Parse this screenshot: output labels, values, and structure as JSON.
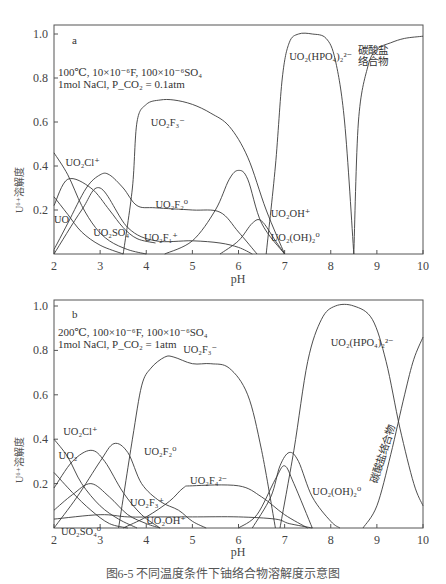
{
  "figure": {
    "caption": "图6-5  不同温度条件下铀络合物溶解度示意图",
    "xlabel": "pH",
    "ylabel": "U⁶⁺溶解度"
  },
  "chart_data": [
    {
      "type": "line",
      "panel": "a",
      "title": "a",
      "conditions_line1": "100℃, 10×10⁻⁶F, 100×10⁻⁶SO₄",
      "conditions_line2": "1mol NaCl, P_CO₂ = 0.1atm",
      "xlabel": "pH",
      "ylabel": "U⁶⁺溶解度",
      "xlim": [
        2,
        10
      ],
      "ylim": [
        0,
        1.0
      ],
      "xticks": [
        "2",
        "3",
        "4",
        "5",
        "6",
        "7",
        "8",
        "9",
        "10"
      ],
      "yticks": [
        "0.2",
        "0.4",
        "0.6",
        "0.8",
        "1.0"
      ],
      "labels": [
        {
          "text": "UO₂F₃⁻",
          "x": 4.1,
          "y": 0.58
        },
        {
          "text": "UO₂(HPO₄)₂²⁻",
          "x": 7.1,
          "y": 0.88
        },
        {
          "text": "碳酸盐",
          "x": 8.6,
          "y": 0.91
        },
        {
          "text": "络合物",
          "x": 8.6,
          "y": 0.86
        },
        {
          "text": "UO₂Cl⁺",
          "x": 2.25,
          "y": 0.4
        },
        {
          "text": "UO₂F₂⁰",
          "x": 4.2,
          "y": 0.21
        },
        {
          "text": "UO",
          "x": 2.0,
          "y": 0.14
        },
        {
          "text": "UO₂SO₄",
          "x": 2.85,
          "y": 0.08
        },
        {
          "text": "UO₂F₁⁺",
          "x": 3.95,
          "y": 0.06
        },
        {
          "text": "UO₂OH⁺",
          "x": 6.7,
          "y": 0.17
        },
        {
          "text": "UO₂(OH)₂⁰",
          "x": 6.7,
          "y": 0.06
        }
      ],
      "series": [
        {
          "name": "UO₂F₃⁻",
          "x": [
            3.5,
            3.7,
            3.8,
            4.0,
            4.3,
            4.6,
            5.0,
            5.4,
            5.8,
            6.2,
            6.6,
            7.0
          ],
          "y": [
            0.0,
            0.3,
            0.6,
            0.68,
            0.7,
            0.7,
            0.68,
            0.64,
            0.58,
            0.44,
            0.2,
            0.0
          ]
        },
        {
          "name": "UO₂(HPO₄)₂²⁻",
          "x": [
            6.6,
            6.8,
            6.95,
            7.1,
            7.3,
            7.6,
            7.9,
            8.1,
            8.3,
            8.5
          ],
          "y": [
            0.0,
            0.4,
            0.8,
            0.96,
            1.0,
            1.0,
            0.98,
            0.88,
            0.6,
            0.0
          ]
        },
        {
          "name": "碳酸盐络合物",
          "x": [
            8.5,
            8.6,
            8.8,
            9.0,
            9.3,
            9.6,
            10.0
          ],
          "y": [
            0.0,
            0.6,
            0.85,
            0.93,
            0.96,
            0.98,
            0.99
          ]
        },
        {
          "name": "UO₂Cl⁺",
          "x": [
            2.0,
            2.3,
            2.6,
            2.9,
            3.2,
            3.6,
            4.0
          ],
          "y": [
            0.46,
            0.36,
            0.22,
            0.12,
            0.06,
            0.02,
            0.0
          ]
        },
        {
          "name": "UO₂F₂⁰",
          "x": [
            2.0,
            2.3,
            2.7,
            3.0,
            3.2,
            3.5,
            3.8,
            4.2,
            5.0,
            5.6,
            6.0,
            6.4
          ],
          "y": [
            0.02,
            0.14,
            0.3,
            0.36,
            0.36,
            0.3,
            0.22,
            0.21,
            0.2,
            0.19,
            0.1,
            0.0
          ]
        },
        {
          "name": "UO₂SO₄",
          "x": [
            2.0,
            2.3,
            2.8,
            3.2,
            3.5,
            3.8,
            4.2
          ],
          "y": [
            0.22,
            0.34,
            0.3,
            0.2,
            0.12,
            0.07,
            0.05
          ]
        },
        {
          "name": "UO₂²⁺",
          "x": [
            2.0,
            2.3,
            2.6,
            3.0,
            3.5
          ],
          "y": [
            0.26,
            0.18,
            0.1,
            0.04,
            0.0
          ]
        },
        {
          "name": "UO₂F⁺",
          "x": [
            2.0,
            2.6,
            3.0,
            3.6,
            4.2,
            5.0,
            5.6,
            6.0,
            6.3
          ],
          "y": [
            0.0,
            0.2,
            0.3,
            0.12,
            0.06,
            0.06,
            0.05,
            0.03,
            0.0
          ]
        },
        {
          "name": "UO₂OH⁺",
          "x": [
            4.4,
            5.0,
            5.5,
            5.8,
            6.0,
            6.2,
            6.5,
            7.0
          ],
          "y": [
            0.0,
            0.06,
            0.2,
            0.34,
            0.38,
            0.34,
            0.14,
            0.0
          ]
        },
        {
          "name": "UO₂(OH)₂⁰",
          "x": [
            5.6,
            6.0,
            6.3,
            6.5,
            6.8,
            7.0
          ],
          "y": [
            0.0,
            0.06,
            0.14,
            0.15,
            0.06,
            0.0
          ]
        }
      ]
    },
    {
      "type": "line",
      "panel": "b",
      "title": "b",
      "conditions_line1": "200℃, 100×10⁻⁶F, 100×10⁻⁶SO₄",
      "conditions_line2": "1mol NaCl, P_CO₂ = 1atm",
      "xlabel": "pH",
      "ylabel": "U⁶⁺溶解度",
      "xlim": [
        2,
        10
      ],
      "ylim": [
        0,
        1.0
      ],
      "xticks": [
        "2",
        "3",
        "4",
        "5",
        "6",
        "7",
        "8",
        "9",
        "10"
      ],
      "yticks": [
        "0.2",
        "0.4",
        "0.6",
        "0.8",
        "1.0"
      ],
      "labels": [
        {
          "text": "UO₂F₃⁻",
          "x": 4.8,
          "y": 0.79
        },
        {
          "text": "UO₂(HPO₄)₂²⁻",
          "x": 8.0,
          "y": 0.82
        },
        {
          "text": "碳酸盐络合物",
          "x": 9.0,
          "y": 0.2,
          "rotated": true
        },
        {
          "text": "UO₂Cl⁺",
          "x": 2.2,
          "y": 0.42
        },
        {
          "text": "UO₂",
          "x": 2.1,
          "y": 0.31
        },
        {
          "text": "UO₂F₂⁰",
          "x": 3.95,
          "y": 0.33
        },
        {
          "text": "UO₂F₄²⁻",
          "x": 4.95,
          "y": 0.2
        },
        {
          "text": "UO₂F₃⁺",
          "x": 3.65,
          "y": 0.1
        },
        {
          "text": "UO₂OH⁺",
          "x": 4.0,
          "y": 0.02
        },
        {
          "text": "UO₂SO₄⁰",
          "x": 2.15,
          "y": -0.03
        },
        {
          "text": "UO₂(OH)₂⁰",
          "x": 7.6,
          "y": 0.15
        }
      ],
      "series": [
        {
          "name": "UO₂F₃⁻",
          "x": [
            3.4,
            3.7,
            3.9,
            4.1,
            4.4,
            4.6,
            5.0,
            5.4,
            5.8,
            6.2,
            6.5,
            6.8
          ],
          "y": [
            0.0,
            0.4,
            0.64,
            0.72,
            0.77,
            0.77,
            0.74,
            0.74,
            0.72,
            0.6,
            0.35,
            0.0
          ]
        },
        {
          "name": "UO₂(HPO₄)₂²⁻",
          "x": [
            6.9,
            7.2,
            7.5,
            7.8,
            8.1,
            8.5,
            8.9,
            9.2,
            9.5,
            9.8,
            10.0
          ],
          "y": [
            0.0,
            0.35,
            0.75,
            0.94,
            1.0,
            1.0,
            0.94,
            0.75,
            0.45,
            0.2,
            0.1
          ]
        },
        {
          "name": "碳酸盐络合物",
          "x": [
            8.7,
            9.0,
            9.3,
            9.6,
            9.8,
            10.0
          ],
          "y": [
            0.0,
            0.1,
            0.33,
            0.6,
            0.76,
            0.86
          ]
        },
        {
          "name": "UO₂Cl⁺",
          "x": [
            2.0,
            2.3,
            2.6,
            3.0,
            3.4,
            3.8
          ],
          "y": [
            0.4,
            0.32,
            0.2,
            0.1,
            0.04,
            0.0
          ]
        },
        {
          "name": "UO₂²⁺",
          "x": [
            2.0,
            2.4,
            2.8,
            3.2,
            3.6
          ],
          "y": [
            0.25,
            0.16,
            0.08,
            0.02,
            0.0
          ]
        },
        {
          "name": "UO₂SO₄⁰",
          "x": [
            2.0,
            2.4,
            2.8,
            3.1,
            3.5,
            3.9,
            4.3
          ],
          "y": [
            0.18,
            0.3,
            0.35,
            0.3,
            0.16,
            0.06,
            0.0
          ]
        },
        {
          "name": "UO₂F₂⁰",
          "x": [
            2.0,
            2.5,
            3.0,
            3.3,
            3.6,
            3.9,
            4.3,
            4.7,
            5.0,
            5.3
          ],
          "y": [
            0.0,
            0.14,
            0.3,
            0.38,
            0.34,
            0.2,
            0.12,
            0.08,
            0.03,
            0.0
          ]
        },
        {
          "name": "UO₂F₃⁺",
          "x": [
            2.0,
            2.4,
            2.8,
            3.2,
            3.6,
            4.0,
            4.3
          ],
          "y": [
            0.08,
            0.15,
            0.2,
            0.14,
            0.06,
            0.02,
            0.0
          ]
        },
        {
          "name": "UO₂F₄²⁻",
          "x": [
            3.5,
            4.0,
            4.5,
            4.8,
            5.0,
            6.0,
            6.5,
            7.0,
            7.5
          ],
          "y": [
            0.0,
            0.05,
            0.12,
            0.18,
            0.19,
            0.19,
            0.14,
            0.06,
            0.0
          ]
        },
        {
          "name": "UO₂OH⁺",
          "x": [
            2.0,
            3.0,
            3.6,
            4.3,
            5.0,
            6.0,
            6.8,
            7.1,
            7.6
          ],
          "y": [
            0.04,
            0.06,
            0.05,
            0.05,
            0.05,
            0.05,
            0.04,
            0.02,
            0.0
          ]
        },
        {
          "name": "UO₂(OH)₂⁰",
          "x": [
            6.3,
            6.7,
            6.9,
            7.1,
            7.3,
            7.6,
            8.0,
            8.2
          ],
          "y": [
            0.0,
            0.14,
            0.28,
            0.34,
            0.3,
            0.14,
            0.03,
            0.0
          ]
        },
        {
          "name": "UO₂(OH)₃⁻",
          "x": [
            6.0,
            6.4,
            6.8,
            7.0,
            7.2,
            7.6
          ],
          "y": [
            0.0,
            0.06,
            0.22,
            0.28,
            0.2,
            0.0
          ]
        }
      ]
    }
  ]
}
